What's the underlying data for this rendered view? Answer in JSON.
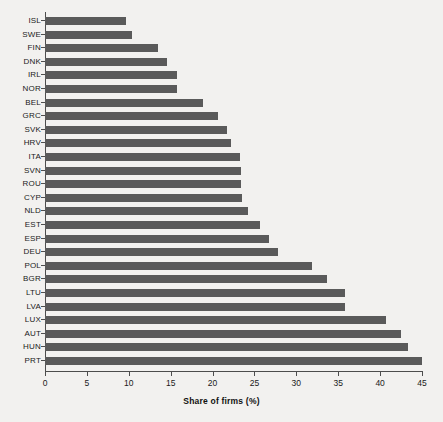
{
  "chart_data": {
    "type": "bar",
    "orientation": "horizontal",
    "title": "",
    "xlabel": "Share of firms (%)",
    "ylabel": "",
    "xlim": [
      0,
      45
    ],
    "xticks": [
      0,
      5,
      10,
      15,
      20,
      25,
      30,
      35,
      40,
      45
    ],
    "grid": false,
    "legend": null,
    "bar_color": "#5a5a5a",
    "background_color": "#f2f1ef",
    "categories": [
      "ISL",
      "SWE",
      "FIN",
      "DNK",
      "IRL",
      "NOR",
      "BEL",
      "GRC",
      "SVK",
      "HRV",
      "ITA",
      "SVN",
      "ROU",
      "CYP",
      "NLD",
      "EST",
      "ESP",
      "DEU",
      "POL",
      "BGR",
      "LTU",
      "LVA",
      "LUX",
      "AUT",
      "HUN",
      "PRT"
    ],
    "values": [
      9.7,
      10.4,
      13.5,
      14.6,
      15.7,
      15.7,
      18.8,
      20.6,
      21.7,
      22.2,
      23.3,
      23.4,
      23.4,
      23.5,
      24.2,
      25.7,
      26.7,
      27.8,
      31.9,
      33.7,
      35.8,
      35.8,
      40.7,
      42.5,
      43.3,
      45.0
    ]
  }
}
